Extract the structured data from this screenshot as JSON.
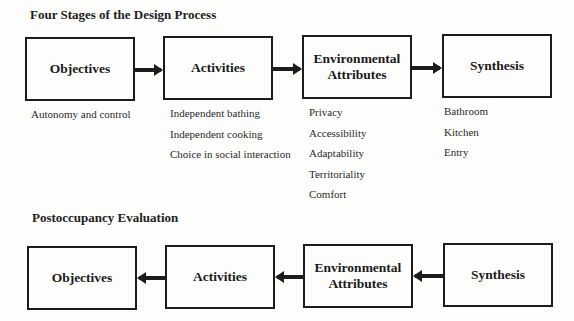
{
  "design_process": {
    "title": "Four Stages of the Design Process",
    "stages": [
      {
        "label_lines": [
          "Objectives"
        ],
        "items": [
          "Autonomy and control"
        ]
      },
      {
        "label_lines": [
          "Activities"
        ],
        "items": [
          "Independent bathing",
          "Independent cooking",
          "Choice in social interaction"
        ]
      },
      {
        "label_lines": [
          "Environmental",
          "Attributes"
        ],
        "items": [
          "Privacy",
          "Accessibility",
          "Adaptability",
          "Territoriality",
          "Comfort"
        ]
      },
      {
        "label_lines": [
          "Synthesis"
        ],
        "items": [
          "Bathroom",
          "Kitchen",
          "Entry"
        ]
      }
    ],
    "arrow_direction": "right"
  },
  "postoccupancy": {
    "title": "Postoccupancy Evaluation",
    "stages": [
      {
        "label_lines": [
          "Objectives"
        ]
      },
      {
        "label_lines": [
          "Activities"
        ]
      },
      {
        "label_lines": [
          "Environmental",
          "Attributes"
        ]
      },
      {
        "label_lines": [
          "Synthesis"
        ]
      }
    ],
    "arrow_direction": "left"
  }
}
